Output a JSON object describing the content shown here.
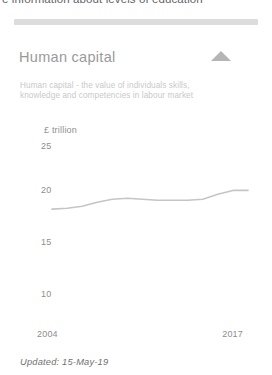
{
  "page": {
    "background_color": "#ffffff",
    "clipped_headline": "e information about levels of education"
  },
  "divider": {
    "color": "#dcdcdc"
  },
  "card": {
    "title": "Human capital",
    "trend_icon": "triangle-up-icon",
    "trend_color": "#b5b5b5",
    "description": "Human capital - the value of individuals skills, knowledge and competencies in labour market",
    "updated_label": "Updated: 15-May-19"
  },
  "chart_data": {
    "type": "line",
    "title": "Human capital",
    "xlabel": "",
    "ylabel": "£ trillion",
    "unit_label": "£ trillion",
    "line_color": "#c5c5c5",
    "grid": false,
    "legend": "none",
    "xlim": [
      2004,
      2017
    ],
    "ylim": [
      10,
      25
    ],
    "yticks": [
      25,
      20,
      15,
      10
    ],
    "xticks": [
      2004,
      2017
    ],
    "x": [
      2004,
      2005,
      2006,
      2007,
      2008,
      2009,
      2010,
      2011,
      2012,
      2013,
      2014,
      2015,
      2016,
      2017
    ],
    "values": [
      18.6,
      18.7,
      18.9,
      19.3,
      19.6,
      19.7,
      19.6,
      19.5,
      19.5,
      19.5,
      19.6,
      20.1,
      20.5,
      20.5
    ],
    "series": [
      {
        "name": "Human capital",
        "values": [
          18.6,
          18.7,
          18.9,
          19.3,
          19.6,
          19.7,
          19.6,
          19.5,
          19.5,
          19.5,
          19.6,
          20.1,
          20.5,
          20.5
        ]
      }
    ]
  }
}
